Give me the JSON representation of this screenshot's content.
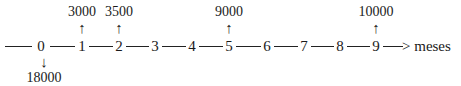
{
  "diagram": {
    "type": "cash-flow-timeline",
    "axis_unit_label": "> meses",
    "periods": [
      "0",
      "1",
      "2",
      "3",
      "4",
      "5",
      "6",
      "7",
      "8",
      "9"
    ],
    "inflows": [
      {
        "period": "1",
        "amount": "3000",
        "arrow": "↑"
      },
      {
        "period": "2",
        "amount": "3500",
        "arrow": "↑"
      },
      {
        "period": "5",
        "amount": "9000",
        "arrow": "↑"
      },
      {
        "period": "9",
        "amount": "10000",
        "arrow": "↑"
      }
    ],
    "outflows": [
      {
        "period": "0",
        "amount": "18000",
        "arrow": "↓"
      }
    ]
  }
}
